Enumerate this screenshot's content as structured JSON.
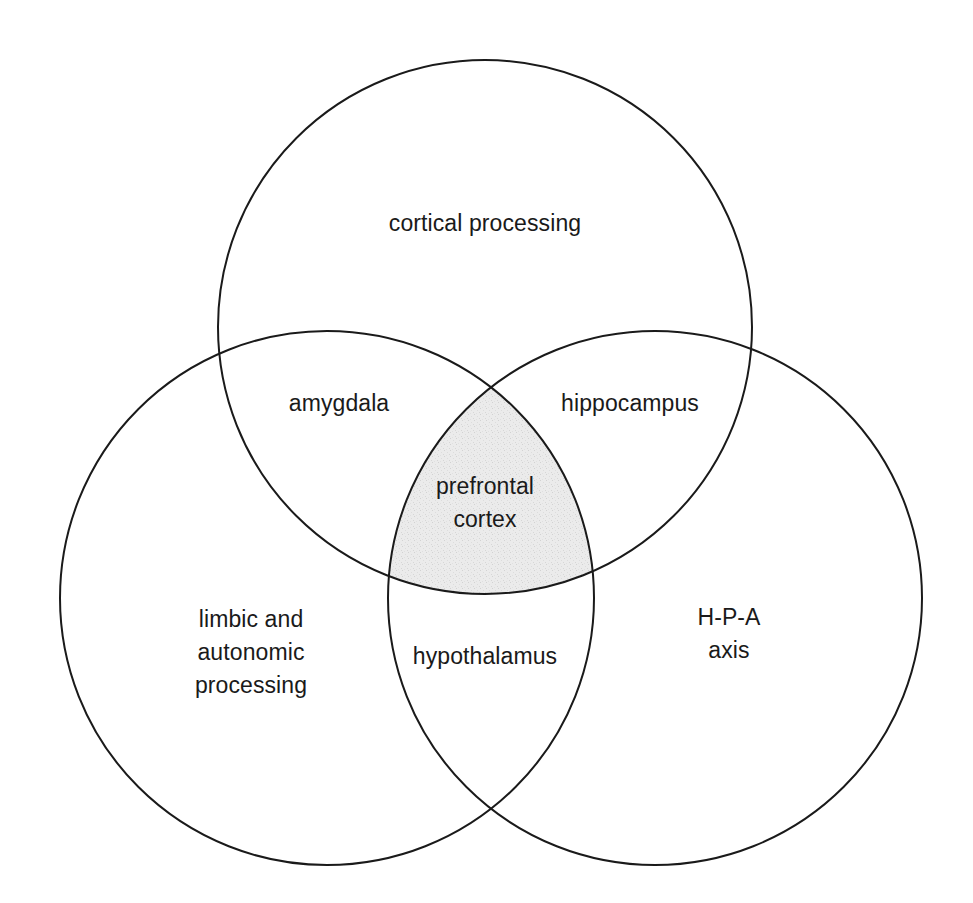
{
  "figure": {
    "type": "venn-diagram-3-set",
    "background_color": "#ffffff",
    "stroke_color": "#1a1a1a",
    "stroke_width": 2,
    "intersection_fill": "#e9e9e9",
    "width": 973,
    "height": 903
  },
  "chart_data": {
    "type": "diagram",
    "title": "",
    "sets": [
      {
        "id": "top",
        "label": "cortical processing",
        "cx": 485,
        "cy": 327,
        "r": 267
      },
      {
        "id": "left",
        "label": "limbic and\nautonomic\nprocessing",
        "cx": 327,
        "cy": 598,
        "r": 267
      },
      {
        "id": "right",
        "label": "H-P-A\naxis",
        "cx": 655,
        "cy": 598,
        "r": 267
      }
    ],
    "regions": [
      {
        "id": "top-only",
        "sets": [
          "top"
        ],
        "label": "cortical processing",
        "x": 485,
        "y": 223,
        "shaded": false
      },
      {
        "id": "left-only",
        "sets": [
          "left"
        ],
        "label": "limbic and\nautonomic\nprocessing",
        "x": 251,
        "y": 652,
        "shaded": false
      },
      {
        "id": "right-only",
        "sets": [
          "right"
        ],
        "label": "H-P-A\naxis",
        "x": 729,
        "y": 634,
        "shaded": false
      },
      {
        "id": "top-left",
        "sets": [
          "top",
          "left"
        ],
        "label": "amygdala",
        "x": 339,
        "y": 403,
        "shaded": false
      },
      {
        "id": "top-right",
        "sets": [
          "top",
          "right"
        ],
        "label": "hippocampus",
        "x": 630,
        "y": 403,
        "shaded": false
      },
      {
        "id": "left-right",
        "sets": [
          "left",
          "right"
        ],
        "label": "hypothalamus",
        "x": 485,
        "y": 656,
        "shaded": false
      },
      {
        "id": "center",
        "sets": [
          "top",
          "left",
          "right"
        ],
        "label": "prefrontal\ncortex",
        "x": 485,
        "y": 503,
        "shaded": true
      }
    ]
  }
}
